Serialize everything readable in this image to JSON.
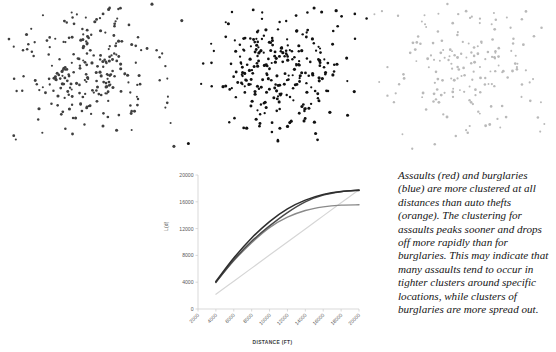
{
  "figure": {
    "background": "#ffffff",
    "caption": "Assaults (red) and burglaries (blue) are more clustered at all distances than auto thefts (orange). The clustering for assaults peaks sooner and drops off more rapidly than for burglaries. This may indicate that many assaults tend to occur in tighter clusters around specific locations, while clusters of burglaries are more spread out."
  },
  "maps": [
    {
      "name": "assaults-point-map",
      "label": "Assaults",
      "point_color": "#3f3f3f",
      "point_count": 300,
      "dispersion": "tight-central-cluster"
    },
    {
      "name": "burglaries-point-map",
      "label": "Burglaries",
      "point_color": "#111111",
      "point_count": 320,
      "dispersion": "dense-central-cluster"
    },
    {
      "name": "auto-thefts-point-map",
      "label": "Auto thefts",
      "point_color": "#b9b9b9",
      "point_count": 300,
      "dispersion": "spread-out"
    }
  ],
  "chart_data": {
    "type": "line",
    "title": "",
    "xlabel": "DISTANCE (FT)",
    "ylabel": "L(d)",
    "xlim": [
      2000,
      20000
    ],
    "ylim": [
      0,
      20000
    ],
    "grid": false,
    "legend": "none",
    "xticks": [
      2000,
      4000,
      6000,
      8000,
      10000,
      12000,
      14000,
      16000,
      18000,
      20000
    ],
    "yticks": [
      0,
      4000,
      8000,
      12000,
      16000,
      20000
    ],
    "x": [
      4000,
      6000,
      8000,
      10000,
      12000,
      14000,
      16000,
      18000,
      20000
    ],
    "series": [
      {
        "name": "Assaults",
        "color": "#2e2e2e",
        "width": 1.6,
        "values": [
          4100,
          7600,
          10600,
          13050,
          14950,
          16250,
          17100,
          17550,
          17700
        ]
      },
      {
        "name": "Burglaries",
        "color": "#4a4a4a",
        "width": 1.5,
        "values": [
          3950,
          7300,
          10100,
          12400,
          14400,
          16000,
          17000,
          17500,
          17750
        ]
      },
      {
        "name": "Auto thefts",
        "color": "#8a8a8a",
        "width": 1.4,
        "values": [
          4050,
          7200,
          9900,
          12150,
          13700,
          14700,
          15250,
          15500,
          15550
        ]
      },
      {
        "name": "Expected (CSR)",
        "color": "#d6d6d6",
        "width": 1.2,
        "values": [
          2200,
          4150,
          6100,
          8050,
          10000,
          11950,
          13900,
          15850,
          17800
        ]
      }
    ]
  }
}
